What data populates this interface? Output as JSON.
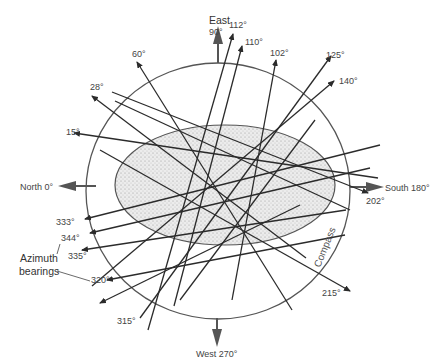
{
  "diagram": {
    "compass_label": "Compass",
    "legend_label_line1": "Azimuth",
    "legend_label_line2": "bearings",
    "cardinals": {
      "east": {
        "name": "East",
        "degrees": "90°"
      },
      "south": "South 180°",
      "west": "West 270°",
      "north": "North 0°"
    },
    "bearings": [
      "112°",
      "110°",
      "102°",
      "125°",
      "140°",
      "60°",
      "28°",
      "15°",
      "202°",
      "215°",
      "333°",
      "344°",
      "335°",
      "320°",
      "315°"
    ],
    "colors": {
      "line": "#2b2b2b",
      "circle": "#555555",
      "ellipse_fill": "#e6e6e6",
      "arrow": "#555555",
      "text": "#444444"
    }
  }
}
